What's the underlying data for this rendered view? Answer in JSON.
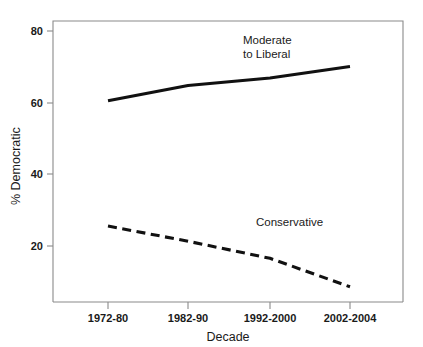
{
  "chart_data": {
    "type": "line",
    "title": "",
    "xlabel": "Decade",
    "ylabel": "% Democratic",
    "categories": [
      "1972-80",
      "1982-90",
      "1992-2000",
      "2002-2004"
    ],
    "series": [
      {
        "name": "Moderate to Liberal",
        "style": "solid",
        "color": "#111111",
        "values": [
          63,
          67,
          69,
          72
        ]
      },
      {
        "name": "Conservative",
        "style": "dashed",
        "color": "#111111",
        "values": [
          30,
          26,
          21.5,
          14
        ]
      }
    ],
    "ylim": [
      10,
      84
    ],
    "yticks": [
      20,
      40,
      60,
      80
    ],
    "ytick_labels": [
      "20",
      "40",
      "60",
      "80"
    ],
    "xtick_labels": [
      "1972-80",
      "1982-90",
      "1992-2000",
      "2002-2004"
    ],
    "grid": false,
    "legend": "inline-annotations",
    "annotations": [
      {
        "text_line1": "Moderate",
        "text_line2": "to Liberal",
        "series": "Moderate to Liberal"
      },
      {
        "text_line1": "Conservative",
        "text_line2": "",
        "series": "Conservative"
      }
    ]
  },
  "axes": {
    "y_tick_0": "20",
    "y_tick_1": "40",
    "y_tick_2": "60",
    "y_tick_3": "80",
    "x_tick_0": "1972-80",
    "x_tick_1": "1982-90",
    "x_tick_2": "1992-2000",
    "x_tick_3": "2002-2004",
    "x_axis_title": "Decade",
    "y_axis_title": "% Democratic"
  },
  "labels": {
    "moderate_line1": "Moderate",
    "moderate_line2": "to Liberal",
    "conservative": "Conservative"
  }
}
